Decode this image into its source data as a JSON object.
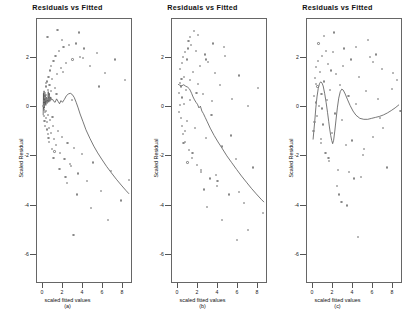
{
  "figure": {
    "background": "#ffffff",
    "point_color": "#888888",
    "curve_color": "#555555",
    "axis_color": "#666666"
  },
  "panels": [
    {
      "id": "panel-a",
      "title": "Residuals vs Fitted",
      "xlabel": "scaled fitted values",
      "ylabel": "Scaled Residual",
      "letter": "(a)",
      "xticks": [
        0,
        2,
        4,
        6,
        8
      ],
      "yticks": [
        2,
        0,
        -2,
        -4,
        -6
      ],
      "xlim": [
        -0.6,
        9.0
      ],
      "ylim": [
        -7.2,
        3.6
      ]
    },
    {
      "id": "panel-b",
      "title": "Residuals vs Fitted",
      "xlabel": "scaled fitted values",
      "ylabel": "Scaled Residual",
      "letter": "(b)",
      "xticks": [
        0,
        2,
        4,
        6,
        8
      ],
      "yticks": [
        2,
        0,
        -2,
        -4,
        -6
      ],
      "xlim": [
        -0.6,
        9.0
      ],
      "ylim": [
        -7.2,
        3.6
      ]
    },
    {
      "id": "panel-c",
      "title": "Residuals vs Fitted",
      "xlabel": "scaled fitted values",
      "ylabel": "Scaled Residual",
      "letter": "(c)",
      "xticks": [
        0,
        2,
        4,
        6,
        8
      ],
      "yticks": [
        2,
        0,
        -2,
        -4,
        -6
      ],
      "xlim": [
        -0.6,
        9.0
      ],
      "ylim": [
        -7.2,
        3.6
      ]
    }
  ],
  "chart_data": [
    {
      "type": "scatter",
      "title": "Residuals vs Fitted",
      "xlabel": "scaled fitted values",
      "ylabel": "Scaled Residual",
      "annotation": "(a)",
      "xlim": [
        -0.6,
        9.0
      ],
      "ylim": [
        -7.2,
        3.6
      ],
      "xticks": [
        0,
        2,
        4,
        6,
        8
      ],
      "yticks": [
        2,
        0,
        -2,
        -4,
        -6
      ],
      "grid": false,
      "legend": "none",
      "series": [
        {
          "name": "residuals",
          "x": [
            0.05,
            0.08,
            0.1,
            0.12,
            0.14,
            0.15,
            0.18,
            0.2,
            0.22,
            0.24,
            0.26,
            0.28,
            0.3,
            0.32,
            0.34,
            0.36,
            0.38,
            0.4,
            0.42,
            0.45,
            0.48,
            0.5,
            0.52,
            0.55,
            0.58,
            0.6,
            0.62,
            0.65,
            0.7,
            0.72,
            0.78,
            0.82,
            0.88,
            0.92,
            0.98,
            1.05,
            1.1,
            1.18,
            1.25,
            1.32,
            1.4,
            1.5,
            1.58,
            1.7,
            1.8,
            1.92,
            2.05,
            2.15,
            2.3,
            2.45,
            2.6,
            2.8,
            2.95,
            3.1,
            3.3,
            3.5,
            3.7,
            3.9,
            4.1,
            4.4,
            4.7,
            5.0,
            5.4,
            5.8,
            6.2,
            6.8,
            7.2,
            7.8,
            8.2,
            8.6,
            0.3,
            0.55,
            0.8,
            1.05,
            1.35,
            1.65,
            2.0,
            2.4,
            2.9,
            3.4,
            4.0,
            4.8,
            5.6,
            6.5,
            1.15,
            1.9,
            2.7,
            3.6,
            0.45,
            0.95,
            1.45,
            2.25,
            3.05
          ],
          "y": [
            0.05,
            -0.1,
            0.25,
            -0.35,
            0.15,
            -0.55,
            0.4,
            -0.2,
            0.6,
            -0.75,
            0.3,
            -0.45,
            0.85,
            -0.15,
            0.5,
            -0.9,
            0.2,
            1.05,
            -0.6,
            0.35,
            -1.1,
            0.7,
            -0.3,
            1.25,
            -0.85,
            0.45,
            -1.4,
            0.9,
            -0.5,
            1.5,
            -1.05,
            0.65,
            -1.7,
            1.15,
            -0.75,
            1.9,
            -1.3,
            0.8,
            2.1,
            -1.55,
            1.35,
            -0.95,
            2.3,
            -1.85,
            1.6,
            -1.2,
            2.45,
            -2.1,
            1.8,
            -1.45,
            2.55,
            -2.4,
            1.95,
            -1.65,
            2.6,
            -2.7,
            2.05,
            -1.9,
            2.4,
            -3.0,
            1.7,
            -2.25,
            2.2,
            -3.4,
            1.4,
            -2.6,
            1.95,
            -3.8,
            1.1,
            -2.95,
            1.0,
            -1.25,
            1.7,
            -2.05,
            0.55,
            -2.5,
            1.45,
            -3.1,
            0.3,
            -3.55,
            2.0,
            -4.1,
            0.85,
            -4.6,
            -1.8,
            2.75,
            -2.3,
            3.05,
            2.85,
            -0.4,
            3.15,
            -2.85,
            -5.2
          ]
        }
      ],
      "smoother": {
        "name": "loess",
        "x": [
          0.03,
          0.06,
          0.09,
          0.12,
          0.15,
          0.18,
          0.22,
          0.26,
          0.3,
          0.34,
          0.38,
          0.42,
          0.46,
          0.5,
          0.55,
          0.6,
          0.66,
          0.72,
          0.8,
          0.9,
          1.0,
          1.1,
          1.25,
          1.4,
          1.55,
          1.7,
          1.85,
          2.0,
          2.2,
          2.4,
          2.6,
          2.8,
          3.0,
          3.2,
          3.4,
          3.6,
          3.8,
          4.1,
          4.4,
          4.8,
          5.2,
          5.6,
          6.0,
          6.5,
          7.0,
          7.5,
          8.0,
          8.5,
          8.8
        ],
        "y": [
          -0.35,
          0.55,
          -0.15,
          0.65,
          -0.05,
          0.45,
          0.1,
          0.5,
          0.05,
          0.4,
          0.15,
          0.35,
          0.2,
          0.3,
          0.62,
          0.18,
          0.55,
          0.22,
          0.4,
          0.28,
          0.3,
          0.22,
          0.18,
          0.32,
          0.22,
          0.12,
          0.25,
          0.18,
          0.3,
          0.45,
          0.52,
          0.55,
          0.5,
          0.38,
          0.18,
          -0.05,
          -0.3,
          -0.62,
          -0.95,
          -1.3,
          -1.62,
          -1.9,
          -2.15,
          -2.45,
          -2.72,
          -2.98,
          -3.22,
          -3.45,
          -3.58
        ]
      }
    },
    {
      "type": "scatter",
      "title": "Residuals vs Fitted",
      "xlabel": "scaled fitted values",
      "ylabel": "Scaled Residual",
      "annotation": "(b)",
      "xlim": [
        -0.6,
        9.0
      ],
      "ylim": [
        -7.2,
        3.6
      ],
      "xticks": [
        0,
        2,
        4,
        6,
        8
      ],
      "yticks": [
        2,
        0,
        -2,
        -4,
        -6
      ],
      "grid": false,
      "legend": "none",
      "series": [
        {
          "name": "residuals",
          "x": [
            0.08,
            0.12,
            0.16,
            0.2,
            0.24,
            0.28,
            0.32,
            0.36,
            0.4,
            0.44,
            0.48,
            0.52,
            0.58,
            0.62,
            0.68,
            0.74,
            0.8,
            0.86,
            0.92,
            1.0,
            1.08,
            1.16,
            1.24,
            1.34,
            1.44,
            1.54,
            1.66,
            1.78,
            1.9,
            2.04,
            2.18,
            2.34,
            2.5,
            2.66,
            2.84,
            3.02,
            3.22,
            3.44,
            3.66,
            3.9,
            4.16,
            4.44,
            4.74,
            5.06,
            5.4,
            5.76,
            6.14,
            6.56,
            7.0,
            7.48,
            8.0,
            8.5,
            0.35,
            0.7,
            1.05,
            1.45,
            1.85,
            2.3,
            2.8,
            3.35,
            3.95,
            4.6,
            5.3,
            6.1,
            7.0,
            0.55,
            1.2,
            2.0,
            2.9,
            3.8,
            1.6,
            2.6,
            3.5,
            0.95,
            4.4,
            5.9
          ],
          "y": [
            0.6,
            -0.2,
            1.0,
            0.1,
            1.55,
            -0.45,
            0.85,
            1.8,
            -0.75,
            0.4,
            2.05,
            -1.1,
            1.25,
            0.15,
            2.25,
            -1.4,
            0.7,
            1.95,
            -0.55,
            2.4,
            -1.75,
            1.1,
            0.3,
            2.55,
            -2.05,
            1.45,
            -0.85,
            2.3,
            -2.35,
            0.95,
            1.7,
            -2.65,
            0.55,
            2.15,
            -1.25,
            1.85,
            -2.9,
            0.25,
            1.4,
            -3.2,
            0.9,
            -1.6,
            2.1,
            -3.55,
            0.35,
            -2.1,
            1.3,
            -3.9,
            0.05,
            -2.45,
            0.8,
            -4.3,
            1.15,
            -0.95,
            2.7,
            -1.85,
            0.6,
            -2.55,
            1.95,
            -0.3,
            -3.0,
            2.45,
            -1.15,
            -3.45,
            -5.0,
            -1.45,
            2.85,
            2.95,
            -4.05,
            -2.75,
            3.1,
            -3.35,
            2.6,
            -2.25,
            -4.6,
            -5.4
          ]
        }
      ],
      "smoother": {
        "name": "loess",
        "x": [
          0.02,
          0.2,
          0.4,
          0.6,
          0.8,
          1.0,
          1.2,
          1.4,
          1.55,
          1.7,
          1.85,
          2.0,
          2.15,
          2.3,
          2.45,
          2.6,
          2.8,
          3.0,
          3.3,
          3.7,
          4.1,
          4.5,
          5.0,
          5.5,
          6.0,
          6.5,
          7.0,
          7.5,
          8.0,
          8.5,
          8.8
        ],
        "y": [
          0.92,
          0.88,
          0.86,
          0.9,
          0.84,
          0.8,
          0.72,
          0.55,
          0.4,
          0.28,
          0.18,
          0.1,
          -0.05,
          0.02,
          -0.18,
          -0.28,
          -0.45,
          -0.62,
          -0.88,
          -1.18,
          -1.45,
          -1.7,
          -2.02,
          -2.3,
          -2.58,
          -2.85,
          -3.1,
          -3.35,
          -3.58,
          -3.8,
          -3.92
        ]
      }
    },
    {
      "type": "scatter",
      "title": "Residuals vs Fitted",
      "xlabel": "scaled fitted values",
      "ylabel": "Scaled Residual",
      "annotation": "(c)",
      "xlim": [
        -0.6,
        9.0
      ],
      "ylim": [
        -7.2,
        3.6
      ],
      "xticks": [
        0,
        2,
        4,
        6,
        8
      ],
      "yticks": [
        2,
        0,
        -2,
        -4,
        -6
      ],
      "grid": false,
      "legend": "none",
      "series": [
        {
          "name": "residuals",
          "x": [
            0.05,
            0.1,
            0.15,
            0.2,
            0.26,
            0.32,
            0.38,
            0.45,
            0.52,
            0.6,
            0.68,
            0.76,
            0.85,
            0.94,
            1.04,
            1.14,
            1.25,
            1.36,
            1.48,
            1.6,
            1.74,
            1.88,
            2.02,
            2.18,
            2.34,
            2.52,
            2.7,
            2.9,
            3.1,
            3.32,
            3.55,
            3.8,
            4.06,
            4.34,
            4.64,
            4.96,
            5.3,
            5.66,
            6.04,
            6.46,
            6.9,
            7.36,
            7.86,
            8.38,
            8.75,
            0.3,
            0.8,
            1.3,
            1.8,
            2.4,
            3.0,
            3.6,
            4.3,
            5.1,
            6.0,
            7.0,
            8.0,
            0.55,
            1.55,
            2.6,
            3.9,
            5.5,
            6.7,
            1.1,
            2.1,
            3.4,
            4.8,
            6.3,
            0.9,
            2.85,
            4.5
          ],
          "y": [
            -0.95,
            0.45,
            -0.6,
            1.2,
            0.2,
            1.65,
            -0.35,
            0.85,
            1.9,
            0.05,
            1.45,
            -1.3,
            0.55,
            2.1,
            -0.7,
            1.05,
            -1.85,
            0.3,
            1.75,
            -2.2,
            0.7,
            -1.05,
            2.25,
            -0.25,
            1.35,
            -2.55,
            0.9,
            -0.5,
            2.4,
            -1.55,
            0.45,
            1.95,
            -2.9,
            0.15,
            1.25,
            -1.95,
            0.65,
            2.05,
            -1.2,
            0.35,
            1.55,
            -2.45,
            0.75,
            1.1,
            -0.15,
            0.95,
            -1.45,
            2.3,
            1.5,
            -3.2,
            1.7,
            -2.65,
            2.45,
            -1.7,
            1.85,
            -0.85,
            1.4,
            2.6,
            -2.05,
            -3.55,
            -1.35,
            2.75,
            -0.45,
            2.9,
            3.05,
            -4.0,
            -2.85,
            2.15,
            -0.05,
            -3.85,
            -5.3
          ]
        }
      ],
      "smoother": {
        "name": "loess",
        "x": [
          0.02,
          0.1,
          0.2,
          0.3,
          0.42,
          0.55,
          0.68,
          0.8,
          0.92,
          1.05,
          1.2,
          1.35,
          1.5,
          1.62,
          1.72,
          1.82,
          1.92,
          2.02,
          2.12,
          2.24,
          2.36,
          2.5,
          2.64,
          2.8,
          2.95,
          3.1,
          3.3,
          3.55,
          3.8,
          4.1,
          4.4,
          4.8,
          5.2,
          5.6,
          6.0,
          6.4,
          6.8,
          7.2,
          7.6,
          8.0,
          8.4,
          8.8
        ],
        "y": [
          -1.35,
          -1.0,
          -0.55,
          -0.05,
          0.4,
          0.75,
          0.95,
          1.02,
          0.98,
          0.85,
          0.55,
          0.18,
          -0.25,
          -0.62,
          -0.92,
          -1.18,
          -1.38,
          -1.52,
          -1.38,
          -1.0,
          -0.55,
          -0.05,
          0.35,
          0.62,
          0.72,
          0.68,
          0.52,
          0.28,
          0.05,
          -0.18,
          -0.35,
          -0.48,
          -0.52,
          -0.52,
          -0.48,
          -0.44,
          -0.4,
          -0.34,
          -0.26,
          -0.16,
          -0.05,
          0.08
        ]
      }
    }
  ]
}
